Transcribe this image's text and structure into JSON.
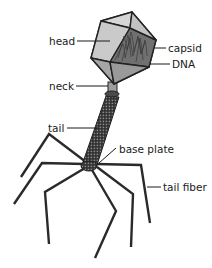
{
  "title_fragment": "",
  "labels": {
    "head": "head",
    "capsid": "capsid",
    "dna": "DNA",
    "neck": "neck",
    "tail": "tail",
    "base_plate": "base plate",
    "tail_fiber": "tail fiber"
  },
  "colors": {
    "face_light": "#d2d2d2",
    "face_mid": "#b4b4b4",
    "face_dark": "#9a9a9a",
    "dna_face": "#707070",
    "neck": "#9e9e9e",
    "tail": "#2c2c2c",
    "line": "#222222"
  }
}
